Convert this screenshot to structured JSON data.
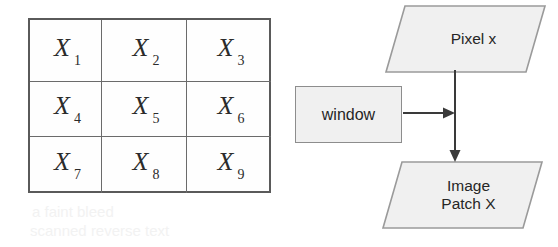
{
  "figure": {
    "background_color": "#ffffff"
  },
  "matrix": {
    "name": "3x3-matrix-grid",
    "rows": 3,
    "cols": 3,
    "border_color": "#5a5a5a",
    "cells": [
      {
        "base": "X",
        "sub": "1"
      },
      {
        "base": "X",
        "sub": "2"
      },
      {
        "base": "X",
        "sub": "3"
      },
      {
        "base": "X",
        "sub": "4"
      },
      {
        "base": "X",
        "sub": "5"
      },
      {
        "base": "X",
        "sub": "6"
      },
      {
        "base": "X",
        "sub": "7"
      },
      {
        "base": "X",
        "sub": "8"
      },
      {
        "base": "X",
        "sub": "9"
      }
    ]
  },
  "diagram": {
    "type": "flowchart",
    "shape_fill": "#f0f0f0",
    "shape_stroke": "#9a9a9a",
    "arrow_color": "#3a3a3a",
    "nodes": [
      {
        "id": "pixel-x",
        "shape": "parallelogram",
        "label": "Pixel x"
      },
      {
        "id": "window",
        "shape": "rectangle",
        "label": "window"
      },
      {
        "id": "image-patch",
        "shape": "parallelogram",
        "label_line1": "Image",
        "label_line2": "Patch X"
      }
    ],
    "edges": [
      {
        "from": "pixel-x",
        "to": "image-patch",
        "direction": "down"
      },
      {
        "from": "window",
        "to": "pixel-x-to-image-patch-edge",
        "direction": "right"
      }
    ]
  },
  "artifacts": {
    "line1": "a faint bleed",
    "line2": "scanned reverse text"
  }
}
